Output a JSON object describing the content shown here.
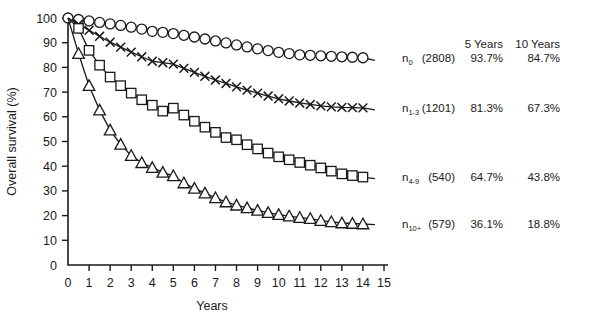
{
  "chart_data": {
    "type": "line",
    "title": "",
    "xlabel": "Years",
    "ylabel": "Overall survival (%)",
    "xlim": [
      0,
      15
    ],
    "ylim": [
      0,
      100
    ],
    "xticks": [
      0,
      1,
      2,
      3,
      4,
      5,
      6,
      7,
      8,
      9,
      10,
      11,
      12,
      13,
      14,
      15
    ],
    "yticks": [
      0,
      10,
      20,
      30,
      40,
      50,
      60,
      70,
      80,
      90,
      100
    ],
    "grid": false,
    "legend_position": "right-inline",
    "x": [
      0,
      0.5,
      1,
      1.5,
      2,
      2.5,
      3,
      3.5,
      4,
      4.5,
      5,
      5.5,
      6,
      6.5,
      7,
      7.5,
      8,
      8.5,
      9,
      9.5,
      10,
      10.5,
      11,
      11.5,
      12,
      12.5,
      13,
      13.5,
      14
    ],
    "series": [
      {
        "name": "n0",
        "label_base": "n",
        "label_sub": "0",
        "marker": "circle",
        "n": "(2808)",
        "survival_5y": "93.7%",
        "survival_10y": "84.7%",
        "values": [
          100,
          99.4,
          98.8,
          98.2,
          97.6,
          97.0,
          96.3,
          95.5,
          94.6,
          94.2,
          93.7,
          93.0,
          92.3,
          91.5,
          90.7,
          89.9,
          89.1,
          88.3,
          87.5,
          86.8,
          86.1,
          85.6,
          85.1,
          84.9,
          84.7,
          84.5,
          84.3,
          84.1,
          83.9
        ]
      },
      {
        "name": "n1-3",
        "label_base": "n",
        "label_sub": "1-3",
        "marker": "cross",
        "n": "(1201)",
        "survival_5y": "81.3%",
        "survival_10y": "67.3%",
        "values": [
          100,
          97.5,
          95.0,
          92.6,
          90.2,
          88.2,
          86.2,
          84.3,
          82.5,
          81.9,
          81.3,
          79.6,
          78.0,
          76.4,
          74.9,
          73.5,
          72.1,
          70.8,
          69.6,
          68.4,
          67.3,
          66.4,
          65.6,
          65.0,
          64.4,
          64.0,
          63.8,
          63.7,
          63.6
        ]
      },
      {
        "name": "n4-9",
        "label_base": "n",
        "label_sub": "4-9",
        "marker": "square",
        "n": "(540)",
        "survival_5y": "64.7%",
        "survival_10y": "43.8%",
        "values": [
          100,
          95.8,
          86.9,
          80.9,
          76.1,
          72.6,
          69.6,
          66.9,
          64.7,
          62.3,
          63.5,
          60.7,
          58.2,
          55.8,
          53.7,
          51.6,
          50.7,
          48.7,
          47.0,
          45.3,
          43.8,
          42.6,
          41.5,
          40.4,
          39.3,
          38.0,
          36.9,
          36.2,
          35.6
        ]
      },
      {
        "name": "n10+",
        "label_base": "n",
        "label_sub": "10+",
        "marker": "triangle",
        "n": "(579)",
        "survival_5y": "36.1%",
        "survival_10y": "18.8%",
        "values": [
          100,
          85.6,
          72.6,
          62.7,
          54.6,
          48.8,
          44.3,
          41.4,
          39.4,
          37.5,
          36.1,
          33.2,
          31.0,
          29.1,
          27.2,
          25.5,
          24.2,
          23.1,
          22.1,
          21.2,
          20.4,
          19.8,
          19.2,
          18.8,
          18.0,
          17.5,
          17.0,
          16.8,
          16.6
        ]
      }
    ]
  },
  "table": {
    "headers": [
      "",
      "",
      "5 Years",
      "10 Years"
    ]
  }
}
